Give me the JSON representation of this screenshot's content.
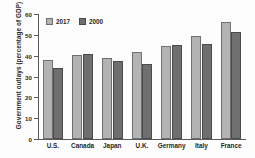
{
  "chart_data": {
    "type": "bar",
    "title": "",
    "subtitle": "",
    "xlabel": "",
    "ylabel": "Government outlays (percentage of GDP)",
    "categories": [
      "U.S.",
      "Canada",
      "Japan",
      "U.K.",
      "Germany",
      "Italy",
      "France"
    ],
    "series": [
      {
        "name": "2017",
        "color": "#b3b3b3",
        "values": [
          38.0,
          40.3,
          39.0,
          42.0,
          44.5,
          49.3,
          56.3
        ]
      },
      {
        "name": "2000",
        "color": "#6f6f6f",
        "values": [
          34.0,
          41.0,
          37.5,
          36.0,
          45.0,
          45.7,
          51.5
        ]
      }
    ],
    "ylim": [
      0,
      60
    ],
    "yticks": [
      0,
      10,
      20,
      30,
      40,
      50,
      60
    ],
    "ytick_labels": [
      "0",
      "10",
      "20",
      "30",
      "40",
      "50",
      "60"
    ],
    "grid": false,
    "legend_position": "top-left"
  }
}
